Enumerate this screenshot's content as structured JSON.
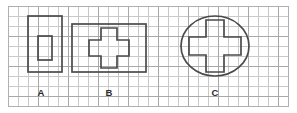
{
  "figure": {
    "background_color": "#ffffff",
    "grid": {
      "minor_color": "#c9c9c9",
      "major_color": "#a8a8a8",
      "cell_size_px": 10,
      "major_every": 3,
      "frame_color": "#b0b0b0"
    },
    "shape_stroke_color": "#4a4a4a"
  },
  "chart_data": {
    "type": "diagram",
    "grid": {
      "cell_size_px": 10,
      "columns": 28,
      "rows": 10,
      "origin_x": 8,
      "origin_y": 6
    },
    "shapes": [
      {
        "label": "A",
        "kind": "rectangle-with-inner-rectangle",
        "outer": {
          "type": "rect",
          "x": 28,
          "y": 16,
          "width": 34,
          "height": 56,
          "grid_width_cells": 3.4,
          "grid_height_cells": 5.6
        },
        "inner": {
          "type": "rect",
          "x": 38,
          "y": 36,
          "width": 14,
          "height": 24,
          "grid_width_cells": 1.4,
          "grid_height_cells": 2.4
        },
        "label_x": 41,
        "label_y": 93
      },
      {
        "label": "B",
        "kind": "rectangle-with-inner-cross",
        "outer": {
          "type": "rect",
          "x": 72,
          "y": 24,
          "width": 74,
          "height": 48,
          "grid_width_cells": 7.4,
          "grid_height_cells": 4.8
        },
        "inner": {
          "type": "cross",
          "center_x": 109,
          "center_y": 48,
          "arm_half_width": 8,
          "arm_half_length": 20,
          "points": "101,28 117,28 117,40 129,40 129,56 117,56 117,68 101,68 101,56 89,56 89,40 101,40"
        },
        "label_x": 109,
        "label_y": 93
      },
      {
        "label": "C",
        "kind": "ellipse-with-inner-cross",
        "outer": {
          "type": "ellipse",
          "center_x": 215,
          "center_y": 46,
          "radius_x": 34,
          "radius_y": 30
        },
        "inner": {
          "type": "cross",
          "center_x": 215,
          "center_y": 46,
          "arm_half_width": 9,
          "arm_half_length": 26,
          "points": "206,20 224,20 224,37 241,37 241,55 224,55 224,72 206,72 206,55 189,55 189,37 206,37"
        },
        "label_x": 215,
        "label_y": 93
      }
    ],
    "labels": [
      "A",
      "B",
      "C"
    ],
    "xlabel": "",
    "ylabel": ""
  }
}
